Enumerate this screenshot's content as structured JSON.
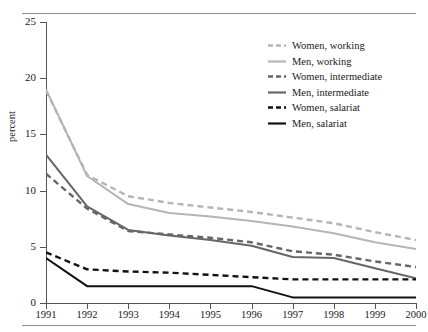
{
  "figure": {
    "has_top_rule": true,
    "has_bottom_rule": true
  },
  "chart_data": {
    "type": "line",
    "title": "",
    "xlabel": "",
    "ylabel": "percent",
    "x": [
      1991,
      1992,
      1993,
      1994,
      1995,
      1996,
      1997,
      1998,
      1999,
      2000
    ],
    "categories": [
      "1991",
      "1992",
      "1993",
      "1994",
      "1995",
      "1996",
      "1997",
      "1998",
      "1999",
      "2000"
    ],
    "xlim": [
      1991,
      2000
    ],
    "ylim": [
      0,
      25
    ],
    "yticks": [
      0,
      5,
      10,
      15,
      20,
      25
    ],
    "ytick_labels": [
      "0",
      "5",
      "10",
      "15",
      "20",
      "25"
    ],
    "grid": false,
    "legend_position": "upper right",
    "series": [
      {
        "name": "Women, working",
        "color": "#b5b5b5",
        "dash": "dashed",
        "values": [
          18.9,
          11.4,
          9.5,
          8.9,
          8.5,
          8.1,
          7.6,
          7.1,
          6.3,
          5.6
        ]
      },
      {
        "name": "Men, working",
        "color": "#b5b5b5",
        "dash": "solid",
        "values": [
          19.0,
          11.3,
          8.8,
          8.0,
          7.7,
          7.3,
          6.8,
          6.2,
          5.4,
          4.8
        ]
      },
      {
        "name": "Women, intermediate",
        "color": "#666666",
        "dash": "dashed",
        "values": [
          11.5,
          8.4,
          6.4,
          6.1,
          5.8,
          5.4,
          4.6,
          4.3,
          3.7,
          3.2
        ]
      },
      {
        "name": "Men, intermediate",
        "color": "#666666",
        "dash": "solid",
        "values": [
          13.2,
          8.6,
          6.5,
          6.0,
          5.6,
          5.1,
          4.1,
          4.0,
          3.1,
          2.2
        ]
      },
      {
        "name": "Women, salariat",
        "color": "#111111",
        "dash": "dashed",
        "values": [
          4.5,
          3.0,
          2.8,
          2.7,
          2.5,
          2.3,
          2.1,
          2.1,
          2.1,
          2.1
        ]
      },
      {
        "name": "Men, salariat",
        "color": "#111111",
        "dash": "solid",
        "values": [
          4.0,
          1.5,
          1.5,
          1.5,
          1.5,
          1.5,
          0.5,
          0.5,
          0.5,
          0.5
        ]
      }
    ]
  },
  "legend": {
    "items": [
      {
        "label": "Women, working"
      },
      {
        "label": "Men, working"
      },
      {
        "label": "Women, intermediate"
      },
      {
        "label": "Men, intermediate"
      },
      {
        "label": "Women, salariat"
      },
      {
        "label": "Men, salariat"
      }
    ]
  }
}
